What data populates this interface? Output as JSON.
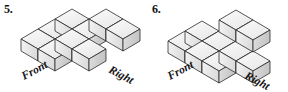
{
  "background_color": "#ffffff",
  "figures": [
    {
      "number_label": "5.",
      "front_label": "Front",
      "right_label": "Right",
      "shape": "L-shaped single-layer stack of cubes",
      "cube_count": 9,
      "layers": 1,
      "cubes": [
        {
          "col": 0,
          "row": 0,
          "level": 0
        },
        {
          "col": 1,
          "row": 0,
          "level": 0
        },
        {
          "col": 2,
          "row": 0,
          "level": 0
        },
        {
          "col": 3,
          "row": 0,
          "level": 0
        },
        {
          "col": 3,
          "row": 1,
          "level": 0
        },
        {
          "col": 3,
          "row": 2,
          "level": 0
        },
        {
          "col": 0,
          "row": 1,
          "level": 0
        },
        {
          "col": 1,
          "row": 1,
          "level": 0
        },
        {
          "col": 2,
          "row": 1,
          "level": 0
        }
      ]
    },
    {
      "number_label": "6.",
      "front_label": "Front",
      "right_label": "Right",
      "shape": "2 by 3 base layer with two cubes stacked on the back right",
      "cube_count": 8,
      "layers": 2,
      "cubes": [
        {
          "col": 0,
          "row": 0,
          "level": 0
        },
        {
          "col": 1,
          "row": 0,
          "level": 0
        },
        {
          "col": 2,
          "row": 0,
          "level": 0
        },
        {
          "col": 0,
          "row": 1,
          "level": 0
        },
        {
          "col": 1,
          "row": 1,
          "level": 0
        },
        {
          "col": 2,
          "row": 1,
          "level": 0
        },
        {
          "col": 2,
          "row": 0,
          "level": 1
        },
        {
          "col": 2,
          "row": 1,
          "level": 1
        }
      ]
    }
  ],
  "colors": {
    "cube_top": "#f2f2f2",
    "cube_left": "#e4e4e4",
    "cube_right": "#d2d2d2",
    "cube_outline": "#2b2b2b",
    "text": "#151515"
  }
}
